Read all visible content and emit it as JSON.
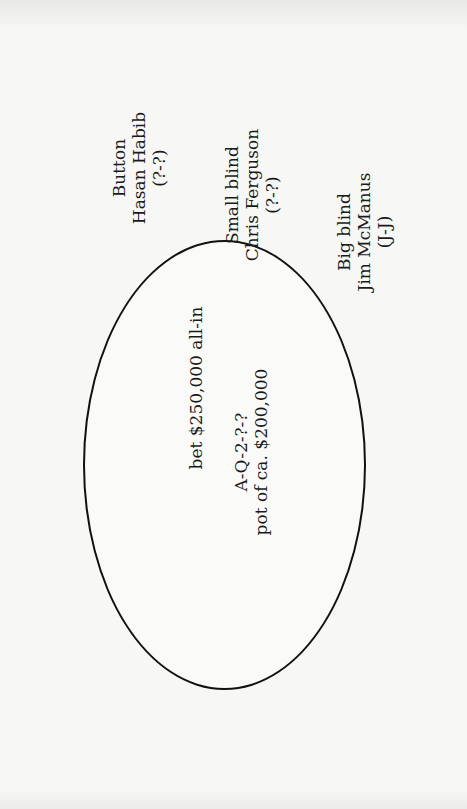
{
  "diagram": {
    "orientation": "rotated -90deg (text reads bottom-to-top)",
    "table": {
      "shape": "ellipse",
      "bet": "bet $250,000 all-in",
      "board": "A-Q-2-?-?",
      "pot": "pot of ca. $200,000"
    },
    "seats": [
      {
        "position": "Button",
        "name": "Hasan Habib",
        "cards": "(?-?)"
      },
      {
        "position": "Small blind",
        "name": "Chris Ferguson",
        "cards": "(?-?)"
      },
      {
        "position": "Big blind",
        "name": "Jim McManus",
        "cards": "(J-J)"
      }
    ]
  }
}
